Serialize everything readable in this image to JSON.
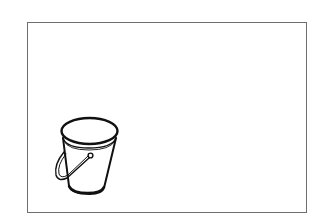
{
  "image": {
    "description": "Line drawing of a bucket with a handle inside a rectangular frame",
    "subject": "bucket",
    "style": "black ink line art on white",
    "colors": {
      "background": "#ffffff",
      "frame": "#6f6f6f",
      "ink": "#111111"
    }
  }
}
